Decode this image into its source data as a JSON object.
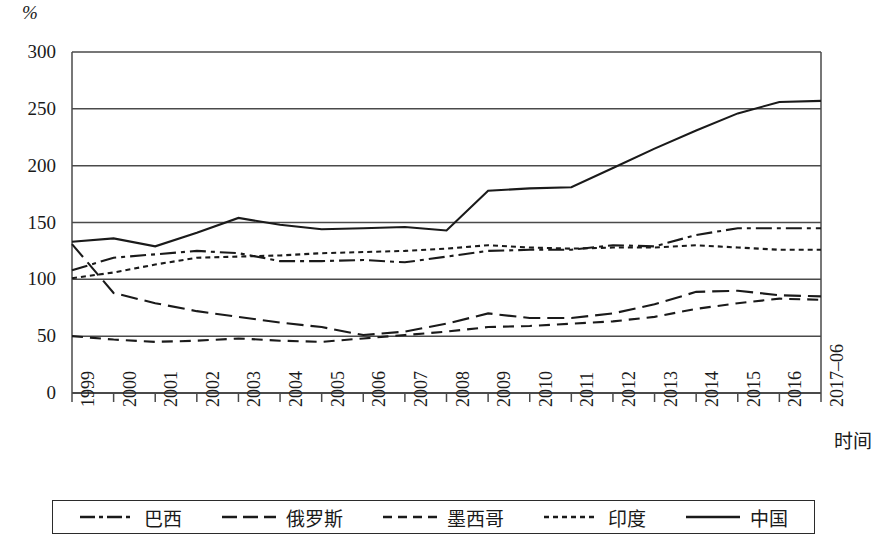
{
  "chart_data": {
    "type": "line",
    "title": "",
    "xlabel": "时间",
    "ylabel": "%",
    "unit_label": "%",
    "grid": true,
    "legend_position": "bottom",
    "ylim": [
      0,
      300
    ],
    "yticks": [
      300,
      250,
      200,
      150,
      100,
      50,
      0
    ],
    "categories": [
      "1999",
      "2000",
      "2001",
      "2002",
      "2003",
      "2004",
      "2005",
      "2006",
      "2007",
      "2008",
      "2009",
      "2010",
      "2011",
      "2012",
      "2013",
      "2014",
      "2015",
      "2016",
      "2017–06"
    ],
    "series": [
      {
        "name": "巴西",
        "style": "dash-dot",
        "values": [
          108,
          119,
          122,
          125,
          123,
          116,
          116,
          117,
          115,
          120,
          125,
          126,
          126,
          130,
          129,
          139,
          145,
          145,
          145
        ]
      },
      {
        "name": "俄罗斯",
        "style": "long-dash",
        "values": [
          131,
          88,
          79,
          72,
          67,
          62,
          58,
          51,
          54,
          61,
          70,
          66,
          66,
          70,
          78,
          89,
          90,
          86,
          85
        ]
      },
      {
        "name": "墨西哥",
        "style": "dashed",
        "values": [
          50,
          47,
          45,
          46,
          48,
          46,
          45,
          48,
          51,
          54,
          58,
          59,
          61,
          63,
          67,
          74,
          79,
          83,
          82
        ]
      },
      {
        "name": "印度",
        "style": "dotted",
        "values": [
          101,
          106,
          113,
          119,
          120,
          121,
          123,
          124,
          125,
          127,
          130,
          128,
          127,
          128,
          128,
          130,
          128,
          126,
          126
        ]
      },
      {
        "name": "中国",
        "style": "solid",
        "values": [
          133,
          136,
          129,
          141,
          154,
          148,
          144,
          145,
          146,
          143,
          178,
          180,
          181,
          198,
          215,
          231,
          246,
          256,
          257
        ]
      }
    ]
  },
  "axes": {
    "unit": "%",
    "x_title": "时间",
    "y_tick_labels": [
      "300",
      "250",
      "200",
      "150",
      "100",
      "50",
      "0"
    ],
    "x_tick_labels": [
      "1999",
      "2000",
      "2001",
      "2002",
      "2003",
      "2004",
      "2005",
      "2006",
      "2007",
      "2008",
      "2009",
      "2010",
      "2011",
      "2012",
      "2013",
      "2014",
      "2015",
      "2016",
      "2017–06"
    ]
  },
  "legend": {
    "items": [
      {
        "label": "巴西",
        "style": "dash-dot"
      },
      {
        "label": "俄罗斯",
        "style": "long-dash"
      },
      {
        "label": "墨西哥",
        "style": "dashed"
      },
      {
        "label": "印度",
        "style": "dotted"
      },
      {
        "label": "中国",
        "style": "solid"
      }
    ]
  },
  "colors": {
    "line": "#1a1a1a",
    "grid": "#4a4a4a",
    "background": "#ffffff"
  }
}
